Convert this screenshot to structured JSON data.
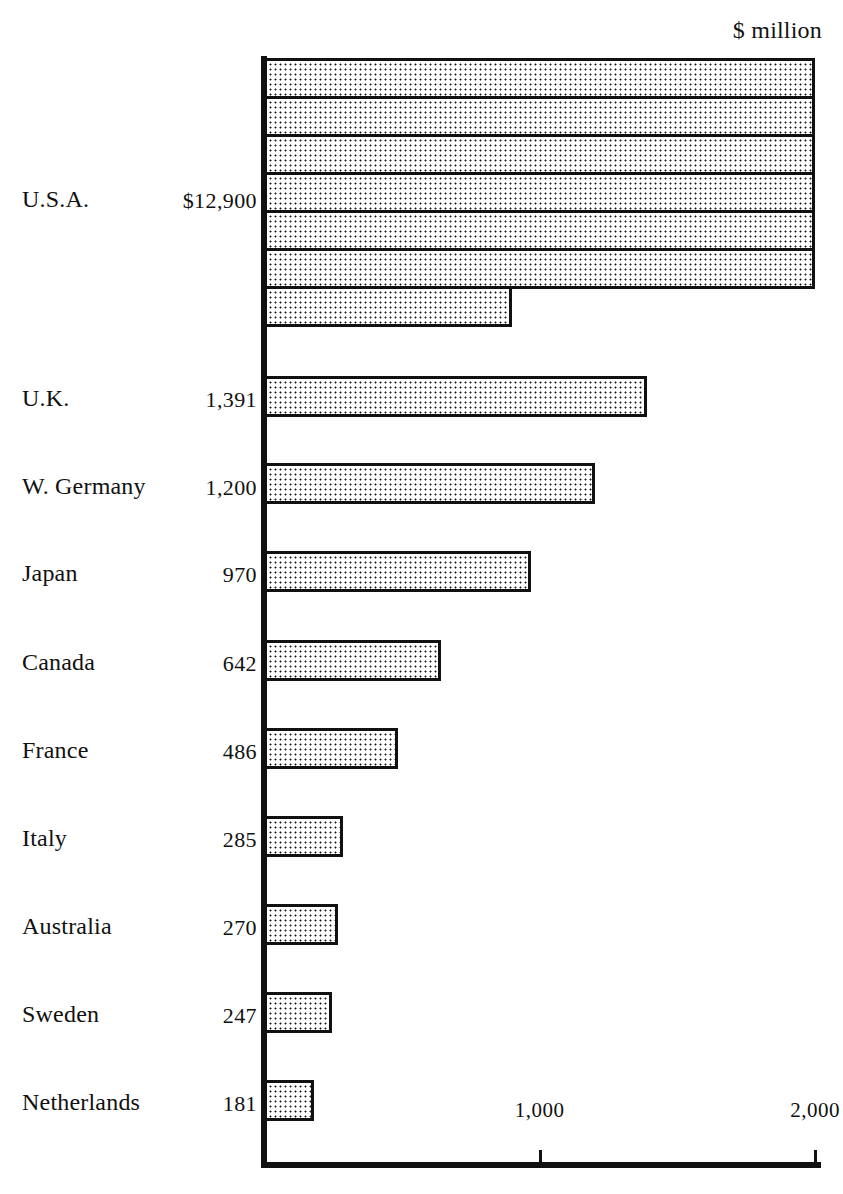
{
  "unit_caption": "$ million",
  "axis": {
    "x_ticks": [
      {
        "label": "1,000",
        "value": 1000
      },
      {
        "label": "2,000",
        "value": 2000
      }
    ],
    "x_max_per_row": 2000,
    "x_min": 0
  },
  "chart_data": {
    "type": "bar",
    "orientation": "horizontal",
    "title": "",
    "subtitle": "",
    "xlabel": "",
    "ylabel": "",
    "unit": "$ million",
    "grid": false,
    "legend": false,
    "note": "The U.S.A. bar is wrapped across 7 stacked rows; each full row spans 2,000 $ million, the final partial row carries the remainder.",
    "axis_note": "Axis spans 0 to 2,000 per row; ticks shown at 1,000 and 2,000.",
    "xlim": [
      0,
      2000
    ],
    "categories": [
      "U.S.A.",
      "U.K.",
      "W. Germany",
      "Japan",
      "Canada",
      "France",
      "Italy",
      "Australia",
      "Sweden",
      "Netherlands"
    ],
    "values": [
      12900,
      1391,
      1200,
      970,
      642,
      486,
      285,
      270,
      247,
      181
    ],
    "value_labels": [
      "$12,900",
      "1,391",
      "1,200",
      "970",
      "642",
      "486",
      "285",
      "270",
      "247",
      "181"
    ]
  },
  "rows": [
    {
      "label": "U.S.A.",
      "value_label": "$12,900",
      "value": 12900,
      "wrapped": true,
      "full_rows": 6,
      "remainder": 900
    },
    {
      "label": "U.K.",
      "value_label": "1,391",
      "value": 1391,
      "wrapped": false
    },
    {
      "label": "W. Germany",
      "value_label": "1,200",
      "value": 1200,
      "wrapped": false
    },
    {
      "label": "Japan",
      "value_label": "970",
      "value": 970,
      "wrapped": false
    },
    {
      "label": "Canada",
      "value_label": "642",
      "value": 642,
      "wrapped": false
    },
    {
      "label": "France",
      "value_label": "486",
      "value": 486,
      "wrapped": false
    },
    {
      "label": "Italy",
      "value_label": "285",
      "value": 285,
      "wrapped": false
    },
    {
      "label": "Australia",
      "value_label": "270",
      "value": 270,
      "wrapped": false
    },
    {
      "label": "Sweden",
      "value_label": "247",
      "value": 247,
      "wrapped": false
    },
    {
      "label": "Netherlands",
      "value_label": "181",
      "value": 181,
      "wrapped": false
    }
  ],
  "colors": {
    "ink": "#111111",
    "paper": "#ffffff",
    "bar_fill": "#ffffff",
    "bar_dots": "#1a1a1a"
  }
}
